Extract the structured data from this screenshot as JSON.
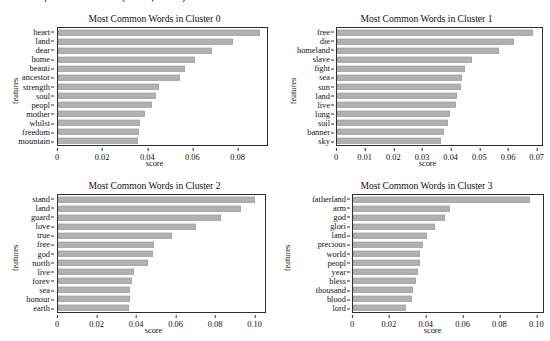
{
  "top_fragment": "potential (220, 13)",
  "figure": {
    "bar_color": "#b2b2b2",
    "axis_color": "#2e2e2e",
    "background": "#ffffff"
  },
  "chart_data": [
    {
      "type": "bar",
      "orientation": "horizontal",
      "title": "Most Common Words in Cluster 0",
      "xlabel": "score",
      "ylabel": "features",
      "grid": false,
      "xlim": [
        0,
        0.0935
      ],
      "xticks": [
        0,
        0.02,
        0.04,
        0.06,
        0.08
      ],
      "xticklabels": [
        "0",
        "0.02",
        "0.04",
        "0.06",
        "0.08"
      ],
      "categories": [
        "heart",
        "land",
        "dear",
        "home",
        "beauti",
        "ancestor",
        "strength",
        "soul",
        "peopl",
        "mother",
        "whilst",
        "freedom",
        "mountain"
      ],
      "values": [
        0.0905,
        0.0782,
        0.0687,
        0.0612,
        0.057,
        0.0546,
        0.045,
        0.0437,
        0.0422,
        0.0388,
        0.0369,
        0.0361,
        0.0356
      ]
    },
    {
      "type": "bar",
      "orientation": "horizontal",
      "title": "Most Common Words in Cluster 1",
      "xlabel": "score",
      "ylabel": "features",
      "grid": false,
      "xlim": [
        0,
        0.0722
      ],
      "xticks": [
        0,
        0.01,
        0.02,
        0.03,
        0.04,
        0.05,
        0.06,
        0.07
      ],
      "xticklabels": [
        "0",
        "0.01",
        "0.02",
        "0.03",
        "0.04",
        "0.05",
        "0.06",
        "0.07"
      ],
      "categories": [
        "free",
        "die",
        "homeland",
        "slave",
        "fight",
        "sea",
        "sun",
        "land",
        "live",
        "long",
        "soil",
        "banner",
        "sky"
      ],
      "values": [
        0.069,
        0.0624,
        0.057,
        0.0475,
        0.0452,
        0.0441,
        0.0437,
        0.0421,
        0.0418,
        0.0399,
        0.039,
        0.0376,
        0.0367
      ]
    },
    {
      "type": "bar",
      "orientation": "horizontal",
      "title": "Most Common Words in Cluster 2",
      "xlabel": "score",
      "ylabel": "features",
      "grid": false,
      "xlim": [
        0,
        0.1058
      ],
      "xticks": [
        0,
        0.02,
        0.04,
        0.06,
        0.08,
        0.1
      ],
      "xticklabels": [
        "0",
        "0.02",
        "0.04",
        "0.06",
        "0.08",
        "0.10"
      ],
      "categories": [
        "stand",
        "land",
        "guard",
        "love",
        "true",
        "free",
        "god",
        "north",
        "live",
        "forev",
        "sea",
        "honour",
        "earth"
      ],
      "values": [
        0.1005,
        0.0937,
        0.0832,
        0.0706,
        0.0583,
        0.0492,
        0.0486,
        0.0462,
        0.0389,
        0.0376,
        0.037,
        0.037,
        0.0363
      ]
    },
    {
      "type": "bar",
      "orientation": "horizontal",
      "title": "Most Common Words in Cluster 3",
      "xlabel": "score",
      "ylabel": "features",
      "grid": false,
      "xlim": [
        0,
        0.1042
      ],
      "xticks": [
        0,
        0.02,
        0.04,
        0.06,
        0.08,
        0.1
      ],
      "xticklabels": [
        "0",
        "0.02",
        "0.04",
        "0.06",
        "0.08",
        "0.10"
      ],
      "categories": [
        "fatherland",
        "arm",
        "god",
        "glori",
        "land",
        "precious",
        "world",
        "peopl",
        "year",
        "bless",
        "thousand",
        "blood",
        "lord"
      ],
      "values": [
        0.0972,
        0.0532,
        0.0504,
        0.045,
        0.0408,
        0.0384,
        0.0366,
        0.0365,
        0.0359,
        0.0345,
        0.0329,
        0.0322,
        0.0291
      ]
    }
  ]
}
